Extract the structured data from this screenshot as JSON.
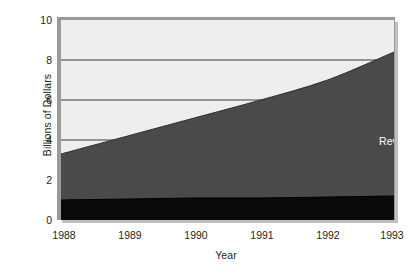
{
  "chart_data": {
    "type": "area",
    "stacked": true,
    "title": "",
    "xlabel": "Year",
    "ylabel": "Billions of Dollars",
    "x": [
      1988,
      1989,
      1990,
      1991,
      1992,
      1993
    ],
    "xtick_labels": [
      "1988",
      "1989",
      "1990",
      "1991",
      "1992",
      "1993"
    ],
    "ytick_labels": [
      "0",
      "2",
      "4",
      "6",
      "8",
      "10"
    ],
    "yticks": [
      0,
      2,
      4,
      6,
      8,
      10
    ],
    "ylim": [
      0,
      10
    ],
    "xlim": [
      1988,
      1993
    ],
    "grid": "horizontal",
    "legend_position": "inline-right",
    "series": [
      {
        "name": "Operating Income",
        "color": "#0a0a0a",
        "label_color": "#ffffff",
        "values": [
          1.0,
          1.05,
          1.1,
          1.1,
          1.15,
          1.2
        ]
      },
      {
        "name": "Revenues",
        "color": "#4a4a4a",
        "label_color": "#ffffff",
        "values": [
          3.3,
          4.2,
          5.1,
          6.0,
          7.0,
          8.4
        ]
      }
    ],
    "annotations": [
      {
        "text": "Revenues",
        "x": 1992.6,
        "y": 5.3
      },
      {
        "text": "Operating Income",
        "x": 1992.2,
        "y": 0.45
      }
    ],
    "colors": {
      "plot_background": "#eeeeee",
      "frame": "#9a9a9a",
      "shadow": "#bfbfbf",
      "gridline": "#3a3a3a",
      "text": "#231f20",
      "page_background": "#ffffff"
    }
  }
}
